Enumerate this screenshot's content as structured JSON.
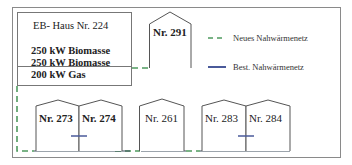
{
  "colors": {
    "frame": "#888888",
    "house_stroke": "#555555",
    "new_network": "#4f9a5f",
    "existing_network": "#4a5a9a",
    "text": "#222222"
  },
  "plant": {
    "title": "EB- Haus Nr. 224",
    "lines": [
      "250 kW Biomasse",
      "250 kW Biomasse",
      "200 kW Gas"
    ]
  },
  "houses": [
    {
      "label": "Nr. 291"
    },
    {
      "label": "Nr. 273"
    },
    {
      "label": "Nr. 274"
    },
    {
      "label": "Nr. 261"
    },
    {
      "label": "Nr. 283"
    },
    {
      "label": "Nr. 284"
    }
  ],
  "legend": {
    "items": [
      {
        "icon": "dashed-line-green",
        "label": "Neues Nahwärmenetz"
      },
      {
        "icon": "solid-line-blue",
        "label": "Best. Nahwärmenetz"
      }
    ]
  }
}
